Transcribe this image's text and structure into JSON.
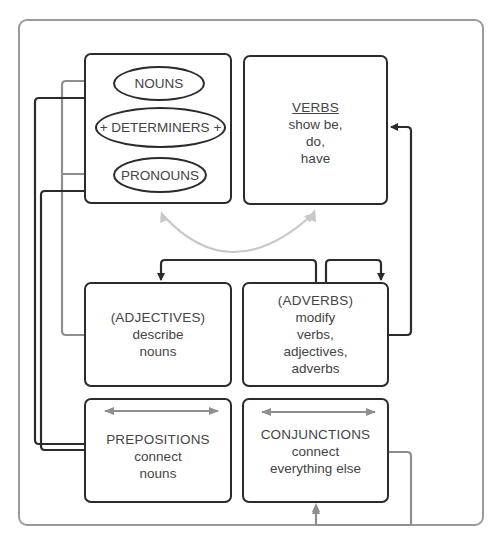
{
  "diagram": {
    "type": "parts-of-speech-relationship-diagram",
    "colors": {
      "frame": "#9a9a9a",
      "box_border": "#2b2b2b",
      "dark_arrow": "#2b2b2b",
      "gray_arrow": "#8f8f8f",
      "light_arrow": "#c8c8c8",
      "text": "#444444"
    },
    "noun_group": {
      "items": [
        {
          "label": "NOUNS"
        },
        {
          "label": "+ DETERMINERS +"
        },
        {
          "label": "PRONOUNS"
        }
      ]
    },
    "boxes": {
      "verbs": {
        "title": "VERBS",
        "lines": [
          "show be,",
          "do,",
          "have"
        ]
      },
      "adjectives": {
        "title": "(ADJECTIVES)",
        "lines": [
          "describe",
          "nouns"
        ]
      },
      "adverbs": {
        "title": "(ADVERBS)",
        "lines": [
          "modify",
          "verbs,",
          "adjectives,",
          "adverbs"
        ]
      },
      "prepositions": {
        "title": "PREPOSITIONS",
        "lines": [
          "connect",
          "nouns"
        ]
      },
      "conjunctions": {
        "title": "CONJUNCTIONS",
        "lines": [
          "connect",
          "everything else"
        ]
      }
    },
    "connections": [
      {
        "from": "adjectives",
        "to": "nouns",
        "style": "gray-arrow"
      },
      {
        "from": "adjectives",
        "to": "pronouns",
        "style": "gray-arrow"
      },
      {
        "from": "prepositions",
        "to": "nouns",
        "style": "dark-arrow"
      },
      {
        "from": "prepositions",
        "to": "pronouns",
        "style": "dark-arrow"
      },
      {
        "from": "verbs",
        "to": "noun_group",
        "style": "light-curved-double-arrow"
      },
      {
        "from": "adverbs",
        "to": "adjectives",
        "style": "dark-arrow"
      },
      {
        "from": "adverbs",
        "to": "adverbs",
        "style": "dark-arrow"
      },
      {
        "from": "adverbs",
        "to": "verbs",
        "style": "dark-arrow"
      },
      {
        "from": "conjunctions",
        "to": "conjunctions",
        "style": "gray-loop-arrow"
      },
      {
        "within": "prepositions",
        "style": "gray-double-arrow"
      },
      {
        "within": "conjunctions",
        "style": "gray-double-arrow"
      }
    ]
  }
}
